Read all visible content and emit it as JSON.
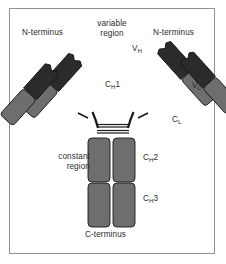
{
  "figure": {
    "kind": "antibody-structure-diagram",
    "frame_border_color": "#8f8f9e",
    "background_color": "#ffffff"
  },
  "colors": {
    "variable_domain": "#2b2b2b",
    "constant_domain": "#6e6e6e",
    "constant_domain_dark": "#5f5f5f",
    "outline": "#1a1a1a",
    "text": "#2b2b2b",
    "hinge_line": "#1a1a1a"
  },
  "labels": {
    "n_terminus_left": "N-terminus",
    "n_terminus_right": "N-terminus",
    "variable_region": "variable region",
    "variable_region_line1": "variable",
    "variable_region_line2": "region",
    "constant_region": "constant region",
    "constant_region_line1": "constant",
    "constant_region_line2": "region",
    "c_terminus": "C-terminus",
    "vh": "V",
    "vh_sub": "H",
    "vl": "V",
    "vl_sub": "L",
    "ch1": "C",
    "ch1_sub": "H",
    "ch1_num": "1",
    "cl": "C",
    "cl_sub": "L",
    "ch2": "C",
    "ch2_sub": "H",
    "ch2_num": "2",
    "ch3": "C",
    "ch3_sub": "H",
    "ch3_num": "3"
  },
  "domains": [
    {
      "id": "vh-left",
      "label": "VH",
      "chain": "heavy",
      "type": "variable",
      "fill": "#2b2b2b"
    },
    {
      "id": "vl-left",
      "label": "VL",
      "chain": "light",
      "type": "variable",
      "fill": "#2b2b2b"
    },
    {
      "id": "ch1-left",
      "label": "CH1",
      "chain": "heavy",
      "type": "constant",
      "fill": "#6e6e6e"
    },
    {
      "id": "cl-left",
      "label": "CL",
      "chain": "light",
      "type": "constant",
      "fill": "#6e6e6e"
    },
    {
      "id": "vh-right",
      "label": "VH",
      "chain": "heavy",
      "type": "variable",
      "fill": "#2b2b2b"
    },
    {
      "id": "vl-right",
      "label": "VL",
      "chain": "light",
      "type": "variable",
      "fill": "#2b2b2b"
    },
    {
      "id": "ch1-right",
      "label": "CH1",
      "chain": "heavy",
      "type": "constant",
      "fill": "#6e6e6e"
    },
    {
      "id": "cl-right",
      "label": "CL",
      "chain": "light",
      "type": "constant",
      "fill": "#6e6e6e"
    },
    {
      "id": "ch2-left",
      "label": "CH2",
      "chain": "heavy",
      "type": "constant",
      "fill": "#6e6e6e"
    },
    {
      "id": "ch2-right",
      "label": "CH2",
      "chain": "heavy",
      "type": "constant",
      "fill": "#6e6e6e"
    },
    {
      "id": "ch3-left",
      "label": "CH3",
      "chain": "heavy",
      "type": "constant",
      "fill": "#6e6e6e"
    },
    {
      "id": "ch3-right",
      "label": "CH3",
      "chain": "heavy",
      "type": "constant",
      "fill": "#6e6e6e"
    }
  ],
  "hinge": {
    "disulfide_bond_count": 2,
    "description": "interchain disulfide bonds"
  }
}
